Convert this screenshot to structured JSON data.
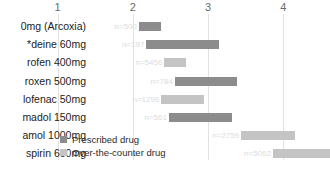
{
  "chart_data": {
    "type": "bar",
    "title": "",
    "subtitle": "",
    "xlabel": "",
    "ylabel": "",
    "xlim": [
      0.6,
      4.4
    ],
    "grid": true,
    "orientation": "horizontal",
    "bar_style": "floating-range",
    "legend_position": "bottom-left",
    "xticks": [
      "1",
      "2",
      "3",
      "4"
    ],
    "xtick_values": [
      1,
      2,
      3,
      4
    ],
    "categories": [
      "Etoricoxib 120mg (Arcoxia)",
      "Paracetamol 1000mg plus codeine 60mg*",
      "Ibuprofen 400mg",
      "Naproxen 500mg",
      "Diclofenac 50mg",
      "Tramadol 150mg",
      "Paracetamol 1000mg",
      "Aspirin 600mg"
    ],
    "legend": [
      {
        "label": "Prescribed drug",
        "color": "#8c8c8c"
      },
      {
        "label": "Over-the-counter drug",
        "color": "#c4c4c4"
      }
    ],
    "series": [
      {
        "name": "Prescribed drug",
        "color": "#8c8c8c",
        "points": [
          {
            "category": "Etoricoxib 120mg (Arcoxia)",
            "value_label": "n=500",
            "low": 2.08,
            "high": 2.38
          },
          {
            "category": "Paracetamol 1000mg plus codeine 60mg*",
            "value_label": "n=197",
            "low": 2.18,
            "high": 3.14
          },
          {
            "category": "Naproxen 500mg",
            "value_label": "n=784",
            "low": 2.56,
            "high": 3.38
          },
          {
            "category": "Tramadol 150mg",
            "value_label": "n=561",
            "low": 2.48,
            "high": 3.32
          }
        ]
      },
      {
        "name": "Over-the-counter drug",
        "color": "#c4c4c4",
        "points": [
          {
            "category": "Ibuprofen 400mg",
            "value_label": "n=5456",
            "low": 2.42,
            "high": 2.7
          },
          {
            "category": "Diclofenac 50mg",
            "value_label": "n=1296",
            "low": 2.38,
            "high": 2.94
          },
          {
            "category": "Paracetamol 1000mg",
            "value_label": "n=2759",
            "low": 3.44,
            "high": 4.16
          },
          {
            "category": "Aspirin 600mg",
            "value_label": "n=5062",
            "low": 3.86,
            "high": 4.62
          }
        ]
      }
    ],
    "rows": [
      {
        "label": "Etoricoxib 120mg (Arcoxia)",
        "short_label": "0mg (Arcoxia)",
        "type": "prescribed",
        "value_label": "n=500",
        "low": 2.08,
        "high": 2.38
      },
      {
        "label": "Paracetamol 1000mg plus codeine 60mg*",
        "short_label": "deine 60mg*",
        "type": "prescribed",
        "value_label": "n=197",
        "low": 2.18,
        "high": 3.14
      },
      {
        "label": "Ibuprofen 400mg",
        "short_label": "rofen 400mg",
        "type": "otc",
        "value_label": "n=5456",
        "low": 2.42,
        "high": 2.7
      },
      {
        "label": "Naproxen 500mg",
        "short_label": "roxen 500mg",
        "type": "prescribed",
        "value_label": "n=784",
        "low": 2.56,
        "high": 3.38
      },
      {
        "label": "Diclofenac 50mg",
        "short_label": "lofenac 50mg",
        "type": "otc",
        "value_label": "n=1296",
        "low": 2.38,
        "high": 2.94
      },
      {
        "label": "Tramadol 150mg",
        "short_label": "madol 150mg",
        "type": "prescribed",
        "value_label": "n=561",
        "low": 2.48,
        "high": 3.32
      },
      {
        "label": "Paracetamol 1000mg",
        "short_label": "amol 1000mg",
        "type": "otc",
        "value_label": "n=2759",
        "low": 3.44,
        "high": 4.16
      },
      {
        "label": "Aspirin 600mg",
        "short_label": "spirin 600mg",
        "type": "otc",
        "value_label": "n=5062",
        "low": 3.86,
        "high": 4.62
      }
    ]
  },
  "caption": {
    "text": ""
  },
  "colors": {
    "prescribed": "#8c8c8c",
    "otc": "#c4c4c4",
    "gridline": "#e2e2e2",
    "tick_text": "#6a6a6a",
    "label_text": "#222222",
    "value_text": "#dcdcdc"
  }
}
